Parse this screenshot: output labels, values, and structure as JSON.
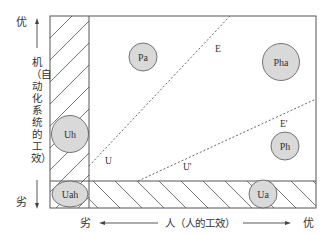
{
  "axes": {
    "y_top_label": "优",
    "y_bottom_label": "劣",
    "y_title": "机（自动化系统的工效）",
    "x_left_label": "劣",
    "x_right_label": "优",
    "x_title": "人（人的工效）"
  },
  "regions": {
    "left_column": "hatched (automation-inferior, human-superior zone)",
    "bottom_row": "hatched (human-inferior zone)"
  },
  "lines": [
    {
      "label": "E",
      "style": "dotted"
    },
    {
      "label": "E'",
      "style": "dotted"
    },
    {
      "label": "U",
      "style": "dotted"
    },
    {
      "label": "U'",
      "style": "dotted"
    }
  ],
  "nodes": {
    "pa": "Pa",
    "pha": "Pha",
    "uh": "Uh",
    "ph": "Ph",
    "uah": "Uah",
    "ua": "Ua"
  },
  "colors": {
    "node_fill": "#d9d9d9",
    "stroke": "#555555"
  }
}
